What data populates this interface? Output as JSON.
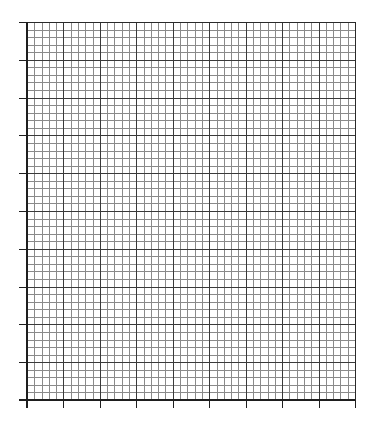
{
  "chart_data": {
    "type": "line",
    "title": "",
    "xlabel": "",
    "ylabel": "",
    "x_major_divisions": 9,
    "y_major_divisions": 10,
    "minor_per_major": 5,
    "xlim": [
      0,
      9
    ],
    "ylim": [
      0,
      10
    ],
    "xticks": [
      "",
      "",
      "",
      "",
      "",
      "",
      "",
      "",
      "",
      ""
    ],
    "yticks": [
      "",
      "",
      "",
      "",
      "",
      "",
      "",
      "",
      "",
      "",
      ""
    ],
    "grid": true,
    "legend": "none",
    "series": [],
    "colors": {
      "background": "#ffffff",
      "minor_grid": "#8a8a8a",
      "major_grid": "#3a3a3a",
      "axis": "#1e1e1e"
    }
  }
}
